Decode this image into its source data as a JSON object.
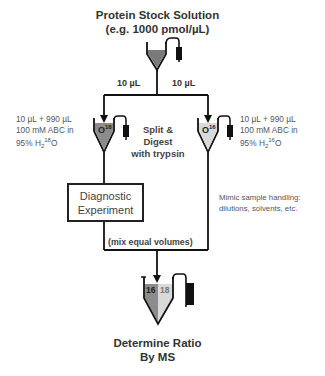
{
  "stock": {
    "title_line1": "Protein Stock Solution",
    "title_line2": "(e.g. 1000 pmol/µL)"
  },
  "split": {
    "left_volume": "10 µL",
    "right_volume": "10 µL",
    "label_line1": "Split &",
    "label_line2": "Digest",
    "label_line3": "with trypsin"
  },
  "left_tube": {
    "label_base": "O",
    "label_isotope": "18",
    "note_line1": "10 µL + 990 µL",
    "note_line2": "100 mM ABC in",
    "note_line3_prefix": "95% H",
    "note_sub": "2",
    "note_sup": "18",
    "note_suffix": "O",
    "fill_color": "#8c8c8c"
  },
  "right_tube": {
    "label_base": "O",
    "label_isotope": "16",
    "note_line1": "10 µL + 990 µL",
    "note_line2": "100 mM ABC in",
    "note_line3_prefix": "95% H",
    "note_sub": "2",
    "note_sup": "16",
    "note_suffix": "O",
    "fill_color": "#d9d9d9"
  },
  "diagnostic_box": {
    "line1": "Diagnostic",
    "line2": "Experiment"
  },
  "mimic_note": {
    "line1": "Mimic sample handling:",
    "line2": "dilutions, solvents, etc."
  },
  "mix_label": "(mix equal volumes)",
  "final_tube": {
    "left_label": "16",
    "right_label": "18",
    "left_color": "#8c8c8c",
    "right_color": "#d9d9d9"
  },
  "result": {
    "line1": "Determine Ratio",
    "line2": "By MS"
  }
}
